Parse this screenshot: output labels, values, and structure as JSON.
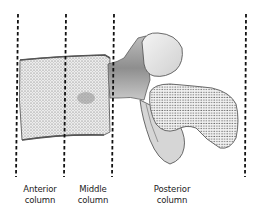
{
  "figure": {
    "divider_style": "dashed",
    "divider_color": "#111111",
    "bone_fill": "#e8e8e8",
    "bone_stroke": "#555555"
  },
  "columns": [
    {
      "line1": "Anterior",
      "line2": "column"
    },
    {
      "line1": "Middle",
      "line2": "column"
    },
    {
      "line1": "Posterior",
      "line2": "column"
    }
  ]
}
